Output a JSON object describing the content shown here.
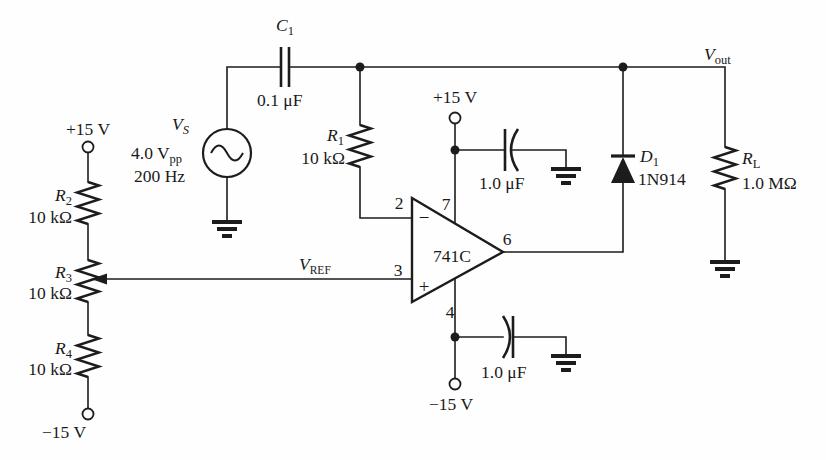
{
  "colors": {
    "line": "#1c1c1c",
    "bg": "#fefefe"
  },
  "schematic": {
    "source": {
      "sym": "V",
      "sub": "S",
      "value1": "4.0 V",
      "value1_sub": "pp",
      "value2": "200 Hz"
    },
    "c1": {
      "sym": "C",
      "sub": "1",
      "value": "0.1 μF"
    },
    "r1": {
      "sym": "R",
      "sub": "1",
      "value": "10 kΩ"
    },
    "r2": {
      "sym": "R",
      "sub": "2",
      "value": "10 kΩ"
    },
    "r3": {
      "sym": "R",
      "sub": "3",
      "value": "10 kΩ"
    },
    "r4": {
      "sym": "R",
      "sub": "4",
      "value": "10 kΩ"
    },
    "rl": {
      "sym": "R",
      "sub": "L",
      "value": "1.0 MΩ"
    },
    "d1": {
      "sym": "D",
      "sub": "1",
      "value": "1N914"
    },
    "bypass_cap_top": {
      "value": "1.0 μF"
    },
    "bypass_cap_bottom": {
      "value": "1.0 μF"
    },
    "opamp": {
      "part": "741C",
      "pin_inverting": "2",
      "pin_noninverting": "3",
      "pin_vminus": "4",
      "pin_output": "6",
      "pin_vplus": "7",
      "inverting_sign": "−",
      "noninverting_sign": "+"
    },
    "vref": {
      "sym": "V",
      "sub": "REF"
    },
    "vout": {
      "sym": "V",
      "sub": "out"
    },
    "rails": {
      "pos_left": "+15 V",
      "neg_left": "−15 V",
      "pos_mid": "+15 V",
      "neg_mid": "−15 V"
    }
  }
}
